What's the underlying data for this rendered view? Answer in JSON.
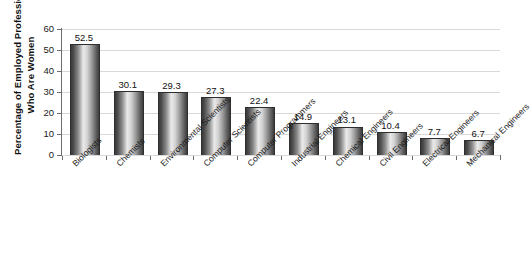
{
  "chart_data": {
    "type": "bar",
    "title": "",
    "xlabel": "",
    "ylabel_lines": [
      "Percentage of Employed Professionals",
      "Who Are Women"
    ],
    "ylabel": "Percentage of Employed Professionals Who Are Women",
    "ylim": [
      0,
      60
    ],
    "ytick_values": [
      0,
      10,
      20,
      30,
      40,
      50,
      60
    ],
    "ytick_labels": [
      "0",
      "10",
      "20",
      "30",
      "40",
      "50",
      "60"
    ],
    "grid": true,
    "grid_axis": "y",
    "legend": false,
    "legend_position": "none",
    "show_value_labels": true,
    "categories": [
      "Biologists",
      "Chemists",
      "Environmental Scientists",
      "Computer Scientists",
      "Computer Programmers",
      "Industrial Engineers",
      "Chemical Engineers",
      "Civil Engineers",
      "Electrical Engineers",
      "Mechanical Engineers"
    ],
    "values": [
      52.5,
      30.1,
      29.3,
      27.3,
      22.4,
      14.9,
      13.1,
      10.4,
      7.7,
      6.7
    ],
    "value_labels": [
      "52.5",
      "30.1",
      "29.3",
      "27.3",
      "22.4",
      "14.9",
      "13.1",
      "10.4",
      "7.7",
      "6.7"
    ],
    "bar_style": "cylinder-gradient-grayscale",
    "colors": {
      "bar_edge": "#3a3a3a",
      "bar_highlight": "#eaeaea",
      "bar_outline": "#2e2e2e",
      "gridline": "#d9d9d9",
      "axis": "#6b6b6b",
      "background": "#ffffff",
      "text": "#1a1a1a"
    }
  }
}
